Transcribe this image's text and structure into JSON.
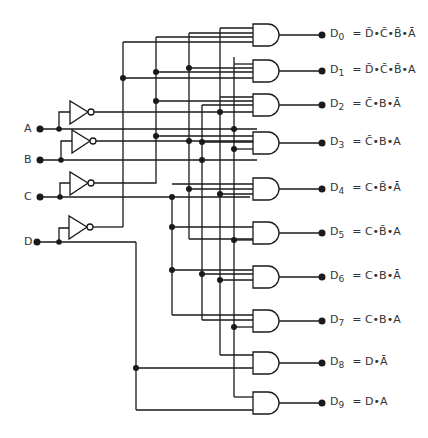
{
  "inputs": [
    {
      "name": "A",
      "label": "A"
    },
    {
      "name": "B",
      "label": "B"
    },
    {
      "name": "C",
      "label": "C"
    },
    {
      "name": "D",
      "label": "D"
    }
  ],
  "outputs": [
    {
      "name": "D",
      "index": "0",
      "expr": "= D̄•C̄•B̄•Ā"
    },
    {
      "name": "D",
      "index": "1",
      "expr": "= D̄•C̄•B̄•A"
    },
    {
      "name": "D",
      "index": "2",
      "expr": "= C̄•B•Ā"
    },
    {
      "name": "D",
      "index": "3",
      "expr": "= C̄•B•A"
    },
    {
      "name": "D",
      "index": "4",
      "expr": "= C•B̄•Ā"
    },
    {
      "name": "D",
      "index": "5",
      "expr": "= C•B̄•A"
    },
    {
      "name": "D",
      "index": "6",
      "expr": "= C•B•Ā"
    },
    {
      "name": "D",
      "index": "7",
      "expr": "= C•B•A"
    },
    {
      "name": "D",
      "index": "8",
      "expr": "= D•Ā"
    },
    {
      "name": "D",
      "index": "9",
      "expr": "= D•A"
    }
  ],
  "diagram": {
    "type": "BCD to decimal decoder logic circuit",
    "gate_type": "AND",
    "inverter_count": 4,
    "and_gate_count": 10
  }
}
